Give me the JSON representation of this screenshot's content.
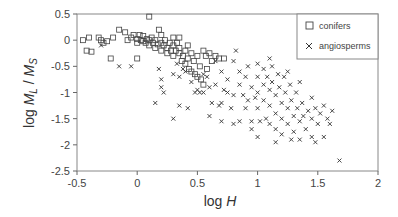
{
  "chart_data": {
    "type": "scatter",
    "title": "",
    "xlabel": "log H",
    "ylabel": "log M_L / M_S",
    "xlim": [
      -0.5,
      2
    ],
    "ylim": [
      -2.5,
      0.5
    ],
    "xticks": [
      "-0.5",
      "0",
      "0.5",
      "1",
      "1.5",
      "2"
    ],
    "yticks": [
      "0.5",
      "0",
      "-0.5",
      "-1",
      "-1.5",
      "-2",
      "-2.5"
    ],
    "grid": false,
    "legend_position": "upper right",
    "series": [
      {
        "name": "conifers",
        "marker": "square",
        "points": [
          [
            -0.45,
            0.0
          ],
          [
            -0.4,
            0.05
          ],
          [
            -0.42,
            -0.2
          ],
          [
            -0.38,
            -0.22
          ],
          [
            -0.32,
            0.05
          ],
          [
            -0.3,
            0.0
          ],
          [
            -0.28,
            -0.05
          ],
          [
            -0.25,
            -0.02
          ],
          [
            -0.2,
            0.05
          ],
          [
            -0.22,
            -0.35
          ],
          [
            -0.15,
            0.2
          ],
          [
            -0.1,
            0.15
          ],
          [
            -0.08,
            0.0
          ],
          [
            -0.05,
            0.05
          ],
          [
            -0.03,
            0.1
          ],
          [
            0.0,
            0.02
          ],
          [
            0.0,
            -0.05
          ],
          [
            0.02,
            0.1
          ],
          [
            0.03,
            0.0
          ],
          [
            0.05,
            -0.02
          ],
          [
            0.05,
            0.08
          ],
          [
            0.07,
            -0.05
          ],
          [
            0.08,
            0.02
          ],
          [
            0.1,
            0.0
          ],
          [
            0.1,
            -0.1
          ],
          [
            0.12,
            0.05
          ],
          [
            0.13,
            -0.05
          ],
          [
            0.15,
            0.0
          ],
          [
            0.15,
            -0.15
          ],
          [
            0.17,
            -0.08
          ],
          [
            0.18,
            0.2
          ],
          [
            0.2,
            -0.05
          ],
          [
            0.2,
            -0.2
          ],
          [
            0.22,
            -0.1
          ],
          [
            0.23,
            0.0
          ],
          [
            0.25,
            -0.15
          ],
          [
            0.25,
            -0.25
          ],
          [
            0.27,
            -0.05
          ],
          [
            0.28,
            -0.2
          ],
          [
            0.3,
            -0.1
          ],
          [
            0.3,
            -0.3
          ],
          [
            0.32,
            -0.2
          ],
          [
            0.33,
            -0.05
          ],
          [
            0.35,
            -0.25
          ],
          [
            0.35,
            -0.15
          ],
          [
            0.37,
            -0.4
          ],
          [
            0.38,
            -0.3
          ],
          [
            0.4,
            -0.45
          ],
          [
            0.4,
            -0.2
          ],
          [
            0.42,
            -0.35
          ],
          [
            0.43,
            -0.55
          ],
          [
            0.45,
            -0.25
          ],
          [
            0.45,
            -0.6
          ],
          [
            0.47,
            -0.4
          ],
          [
            0.48,
            -0.65
          ],
          [
            0.5,
            -0.3
          ],
          [
            0.5,
            -0.7
          ],
          [
            0.52,
            -0.5
          ],
          [
            0.53,
            -0.75
          ],
          [
            0.55,
            -0.2
          ],
          [
            0.55,
            -0.85
          ],
          [
            0.57,
            -0.3
          ],
          [
            0.58,
            -0.55
          ],
          [
            0.6,
            -0.25
          ],
          [
            0.62,
            -0.4
          ],
          [
            0.65,
            -0.3
          ],
          [
            0.68,
            -0.35
          ],
          [
            0.72,
            -0.35
          ],
          [
            0.1,
            0.45
          ],
          [
            0.35,
            0.05
          ],
          [
            0.0,
            -0.35
          ],
          [
            0.2,
            0.1
          ],
          [
            0.42,
            -0.1
          ],
          [
            0.3,
            0.05
          ]
        ]
      },
      {
        "name": "angiosperms",
        "marker": "x",
        "points": [
          [
            -0.3,
            -0.1
          ],
          [
            -0.15,
            -0.5
          ],
          [
            -0.05,
            -0.5
          ],
          [
            0.18,
            -0.55
          ],
          [
            0.2,
            -0.75
          ],
          [
            0.2,
            -0.9
          ],
          [
            0.3,
            -0.65
          ],
          [
            0.35,
            -0.7
          ],
          [
            0.33,
            -0.45
          ],
          [
            0.38,
            -0.55
          ],
          [
            0.4,
            -0.6
          ],
          [
            0.45,
            -0.8
          ],
          [
            0.48,
            -1.0
          ],
          [
            0.5,
            -0.95
          ],
          [
            0.52,
            -1.0
          ],
          [
            0.55,
            -0.65
          ],
          [
            0.58,
            -0.7
          ],
          [
            0.6,
            -0.9
          ],
          [
            0.62,
            -1.2
          ],
          [
            0.65,
            -0.85
          ],
          [
            0.68,
            -1.25
          ],
          [
            0.7,
            -0.6
          ],
          [
            0.72,
            -0.95
          ],
          [
            0.75,
            -1.0
          ],
          [
            0.78,
            -1.3
          ],
          [
            0.8,
            -1.05
          ],
          [
            0.8,
            -0.4
          ],
          [
            0.82,
            -0.2
          ],
          [
            0.85,
            -0.85
          ],
          [
            0.85,
            -1.55
          ],
          [
            0.88,
            -1.05
          ],
          [
            0.9,
            -0.7
          ],
          [
            0.9,
            -1.3
          ],
          [
            0.92,
            -0.5
          ],
          [
            0.95,
            -0.9
          ],
          [
            0.95,
            -1.55
          ],
          [
            0.98,
            -1.1
          ],
          [
            1.0,
            -0.45
          ],
          [
            1.0,
            -0.7
          ],
          [
            1.0,
            -1.0
          ],
          [
            1.0,
            -1.3
          ],
          [
            1.02,
            -1.55
          ],
          [
            1.05,
            -0.55
          ],
          [
            1.05,
            -0.85
          ],
          [
            1.05,
            -1.15
          ],
          [
            1.07,
            -1.5
          ],
          [
            1.08,
            -0.7
          ],
          [
            1.1,
            -0.95
          ],
          [
            1.1,
            -1.25
          ],
          [
            1.1,
            -1.6
          ],
          [
            1.12,
            -0.5
          ],
          [
            1.12,
            -0.8
          ],
          [
            1.15,
            -1.05
          ],
          [
            1.15,
            -1.4
          ],
          [
            1.15,
            -1.7
          ],
          [
            1.17,
            -0.65
          ],
          [
            1.18,
            -0.9
          ],
          [
            1.2,
            -1.2
          ],
          [
            1.2,
            -1.5
          ],
          [
            1.2,
            -1.8
          ],
          [
            1.22,
            -0.7
          ],
          [
            1.23,
            -1.0
          ],
          [
            1.25,
            -1.3
          ],
          [
            1.25,
            -1.6
          ],
          [
            1.27,
            -0.85
          ],
          [
            1.28,
            -1.15
          ],
          [
            1.3,
            -1.45
          ],
          [
            1.3,
            -1.75
          ],
          [
            1.32,
            -1.0
          ],
          [
            1.33,
            -1.3
          ],
          [
            1.35,
            -1.55
          ],
          [
            1.35,
            -1.9
          ],
          [
            1.37,
            -1.2
          ],
          [
            1.38,
            -1.45
          ],
          [
            1.4,
            -1.7
          ],
          [
            1.42,
            -1.35
          ],
          [
            1.45,
            -1.5
          ],
          [
            1.45,
            -1.85
          ],
          [
            1.48,
            -1.3
          ],
          [
            1.5,
            -1.6
          ],
          [
            1.52,
            -1.4
          ],
          [
            1.55,
            -1.85
          ],
          [
            1.58,
            -1.5
          ],
          [
            1.62,
            -1.35
          ],
          [
            1.68,
            -2.3
          ],
          [
            1.48,
            -1.95
          ],
          [
            0.55,
            -1.0
          ],
          [
            0.6,
            -1.45
          ],
          [
            0.42,
            -1.3
          ],
          [
            0.35,
            -1.25
          ],
          [
            0.3,
            -1.5
          ],
          [
            0.15,
            -1.2
          ],
          [
            0.22,
            -1.0
          ],
          [
            0.65,
            -0.4
          ],
          [
            0.7,
            -1.2
          ],
          [
            0.75,
            -0.75
          ],
          [
            0.85,
            -0.6
          ],
          [
            0.92,
            -1.15
          ],
          [
            1.1,
            -0.35
          ],
          [
            1.25,
            -0.6
          ],
          [
            1.35,
            -0.8
          ],
          [
            1.45,
            -1.1
          ],
          [
            1.55,
            -1.25
          ],
          [
            1.6,
            -1.6
          ],
          [
            1.0,
            -1.85
          ],
          [
            1.15,
            -1.95
          ],
          [
            1.28,
            -1.9
          ],
          [
            0.95,
            -1.7
          ],
          [
            0.8,
            -1.6
          ],
          [
            0.7,
            -1.55
          ]
        ]
      }
    ]
  },
  "legend": {
    "items": [
      {
        "label": "conifers",
        "marker": "square"
      },
      {
        "label": "angiosperms",
        "marker": "x"
      }
    ]
  },
  "axes": {
    "xlabel_prefix": "log ",
    "xlabel_var": "H",
    "ylabel_prefix": "log ",
    "ylabel_var1": "M",
    "ylabel_sub1": "L",
    "ylabel_sep": " / ",
    "ylabel_var2": "M",
    "ylabel_sub2": "S"
  },
  "colors": {
    "axis": "#666666",
    "marker": "#333333",
    "frame": "#888888"
  }
}
